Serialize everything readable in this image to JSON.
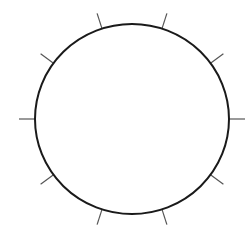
{
  "diagram": {
    "type": "circle-with-radial-ticks",
    "center": [
      132,
      119
    ],
    "radius_x": 97,
    "radius_y": 95,
    "circle_stroke_color": "#1a1a1a",
    "circle_stroke_width": 2,
    "tick_color": "#555555",
    "tick_count": 10,
    "tick_angles_deg": [
      0,
      36,
      72,
      108,
      144,
      180,
      216,
      252,
      288,
      324
    ],
    "tick_length": 16,
    "tick_stroke_width": 1.2
  }
}
